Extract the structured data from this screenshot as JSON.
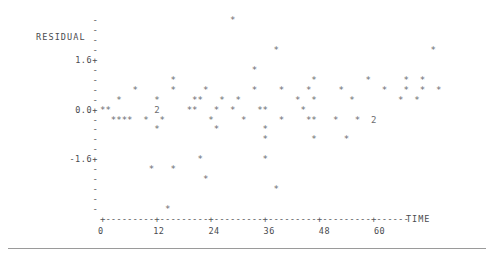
{
  "figure": {
    "kind": "ascii-scatter-plot",
    "y_axis_label": "RESIDUAL",
    "x_axis_label": "TIME",
    "plot_marker": "*",
    "overplot_marker": "2",
    "tick_marker": "-",
    "axis_tick_marker": "+",
    "ink_color": "#55565a",
    "marker_color": "#6b6c70",
    "background": "#ffffff",
    "rule_color": "#9a9a9a"
  },
  "y_axis": {
    "labeled_ticks": [
      "1.6+",
      "0.0+",
      "-1.6+"
    ],
    "plain_tick": "-",
    "rows": [
      "-",
      "-",
      "-",
      "-",
      "1.6+",
      "-",
      "-",
      "-",
      "-",
      "0.0+",
      "-",
      "-",
      "-",
      "-",
      "-1.6+",
      "-",
      "-",
      "-",
      "-",
      "-"
    ],
    "label_row_index": 1,
    "range": [
      -2.4,
      2.4
    ],
    "tick_values": [
      2.4,
      2.0,
      1.6,
      1.2,
      0.8,
      0.4,
      0.0,
      -0.4,
      -0.8,
      -1.2,
      -1.6,
      -2.0,
      -2.4
    ]
  },
  "x_axis": {
    "line": "+---------+---------+---------+---------+---------+------",
    "tick_labels": [
      "0",
      "12",
      "24",
      "36",
      "48",
      "60"
    ],
    "tick_values": [
      0,
      12,
      24,
      36,
      48,
      60
    ],
    "units_per_char": 1.2,
    "range": [
      0,
      67
    ]
  },
  "chart_data": {
    "type": "scatter",
    "title": "",
    "xlabel": "TIME",
    "ylabel": "RESIDUAL",
    "xlim": [
      0,
      67
    ],
    "ylim": [
      -2.4,
      2.4
    ],
    "grid": false,
    "legend": null,
    "marker": "*",
    "note": "Monospace character plot; '2' denotes two coincident observations.",
    "rows": [
      {
        "row": 0,
        "y": 2.4,
        "text": "                        *"
      },
      {
        "row": 1,
        "y": 2.2,
        "text": ""
      },
      {
        "row": 2,
        "y": 2.0,
        "text": ""
      },
      {
        "row": 3,
        "y": 1.8,
        "text": "                                *                            *"
      },
      {
        "row": 4,
        "y": 1.6,
        "text": ""
      },
      {
        "row": 5,
        "y": 1.4,
        "text": "                            *"
      },
      {
        "row": 6,
        "y": 1.2,
        "text": "             *                         *         *      *  *"
      },
      {
        "row": 7,
        "y": 1.0,
        "text": "      *      *     *        *    *    *     *       *   *  *  *"
      },
      {
        "row": 8,
        "y": 0.8,
        "text": "   *      *      **   *  *          *  *      *        *  *"
      },
      {
        "row": 9,
        "y": 0.6,
        "text": "**        2     **   *  *    **      *"
      },
      {
        "row": 10,
        "y": 0.4,
        "text": "  ****  *  *        *     *      *    **   *   *  2"
      },
      {
        "row": 11,
        "y": 0.2,
        "text": "          *          *        *"
      },
      {
        "row": 12,
        "y": 0.0,
        "text": "                              *        *     *"
      },
      {
        "row": 13,
        "y": -0.2,
        "text": ""
      },
      {
        "row": 14,
        "y": -0.4,
        "text": "                  *           *"
      },
      {
        "row": 15,
        "y": -0.6,
        "text": "         *   *"
      },
      {
        "row": 16,
        "y": -0.8,
        "text": "                   *"
      },
      {
        "row": 17,
        "y": -1.0,
        "text": "                                *"
      },
      {
        "row": 18,
        "y": -1.2,
        "text": ""
      },
      {
        "row": 19,
        "y": -1.4,
        "text": "            *"
      }
    ],
    "points": [
      {
        "x": 22.8,
        "y": 2.4
      },
      {
        "x": 30.0,
        "y": 1.8
      },
      {
        "x": 53.6,
        "y": 1.8
      },
      {
        "x": 26.4,
        "y": 1.4
      },
      {
        "x": 14.4,
        "y": 1.2
      },
      {
        "x": 33.6,
        "y": 1.2
      },
      {
        "x": 44.4,
        "y": 1.2
      },
      {
        "x": 51.6,
        "y": 1.2
      },
      {
        "x": 56.4,
        "y": 1.2
      },
      {
        "x": 6.0,
        "y": 1.0
      },
      {
        "x": 14.4,
        "y": 1.0
      },
      {
        "x": 21.6,
        "y": 1.0
      },
      {
        "x": 30.0,
        "y": 1.0
      },
      {
        "x": 34.8,
        "y": 1.0
      },
      {
        "x": 39.6,
        "y": 1.0
      },
      {
        "x": 46.8,
        "y": 1.0
      },
      {
        "x": 54.0,
        "y": 1.0
      },
      {
        "x": 57.6,
        "y": 1.0
      },
      {
        "x": 60.0,
        "y": 1.0
      },
      {
        "x": 63.6,
        "y": 1.0
      },
      {
        "x": 2.4,
        "y": 0.8
      },
      {
        "x": 10.8,
        "y": 0.8
      },
      {
        "x": 18.0,
        "y": 0.8
      },
      {
        "x": 19.2,
        "y": 0.8
      },
      {
        "x": 25.2,
        "y": 0.8
      },
      {
        "x": 28.8,
        "y": 0.8
      },
      {
        "x": 43.2,
        "y": 0.8
      },
      {
        "x": 46.8,
        "y": 0.8
      },
      {
        "x": 54.0,
        "y": 0.8
      },
      {
        "x": 60.0,
        "y": 0.8
      },
      {
        "x": 63.6,
        "y": 0.8
      },
      {
        "x": 0.0,
        "y": 0.6
      },
      {
        "x": 1.2,
        "y": 0.6
      },
      {
        "x": 12.0,
        "y": 0.6
      },
      {
        "x": 19.2,
        "y": 0.6
      },
      {
        "x": 20.4,
        "y": 0.6
      },
      {
        "x": 25.2,
        "y": 0.6
      },
      {
        "x": 28.8,
        "y": 0.6
      },
      {
        "x": 34.8,
        "y": 0.6
      },
      {
        "x": 36.0,
        "y": 0.6
      },
      {
        "x": 44.4,
        "y": 0.6
      },
      {
        "x": 2.4,
        "y": 0.4
      },
      {
        "x": 3.6,
        "y": 0.4
      },
      {
        "x": 4.8,
        "y": 0.4
      },
      {
        "x": 6.0,
        "y": 0.4
      },
      {
        "x": 9.6,
        "y": 0.4
      },
      {
        "x": 13.2,
        "y": 0.4
      },
      {
        "x": 24.0,
        "y": 0.4
      },
      {
        "x": 30.0,
        "y": 0.4
      },
      {
        "x": 39.6,
        "y": 0.4
      },
      {
        "x": 46.8,
        "y": 0.4
      },
      {
        "x": 48.0,
        "y": 0.4
      },
      {
        "x": 51.6,
        "y": 0.4
      },
      {
        "x": 57.6,
        "y": 0.4
      },
      {
        "x": 60.0,
        "y": 0.4
      },
      {
        "x": 12.0,
        "y": 0.2
      },
      {
        "x": 25.2,
        "y": 0.2
      },
      {
        "x": 36.0,
        "y": 0.2
      },
      {
        "x": 36.0,
        "y": 0.0
      },
      {
        "x": 46.8,
        "y": 0.0
      },
      {
        "x": 54.0,
        "y": 0.0
      },
      {
        "x": 21.6,
        "y": -0.4
      },
      {
        "x": 36.0,
        "y": -0.4
      },
      {
        "x": 10.8,
        "y": -0.6
      },
      {
        "x": 15.6,
        "y": -0.6
      },
      {
        "x": 22.8,
        "y": -0.8
      },
      {
        "x": 38.4,
        "y": -1.0
      },
      {
        "x": 14.4,
        "y": -1.4
      }
    ]
  }
}
